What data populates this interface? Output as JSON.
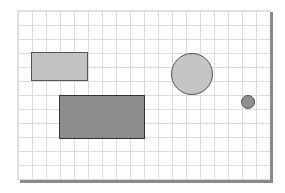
{
  "canvas": {
    "background": "#ffffff",
    "grid_color": "#dcdcdc",
    "grid_spacing": 14,
    "shadow_color": "#8a8a8a"
  },
  "shapes": [
    {
      "id": "light-rectangle",
      "type": "rectangle",
      "x": 31,
      "y": 52,
      "width": 57,
      "height": 29,
      "fill": "#c2c2c2",
      "stroke": "#555555"
    },
    {
      "id": "dark-rectangle",
      "type": "rectangle",
      "x": 59,
      "y": 95,
      "width": 86,
      "height": 44,
      "fill": "#8c8c8c",
      "stroke": "#333333"
    },
    {
      "id": "large-circle",
      "type": "circle",
      "cx": 192,
      "cy": 74,
      "r": 21,
      "fill": "#c4c4c4",
      "stroke": "#555555"
    },
    {
      "id": "small-circle",
      "type": "circle",
      "cx": 248,
      "cy": 102,
      "r": 7,
      "fill": "#8e8e8e",
      "stroke": "#555555"
    }
  ]
}
